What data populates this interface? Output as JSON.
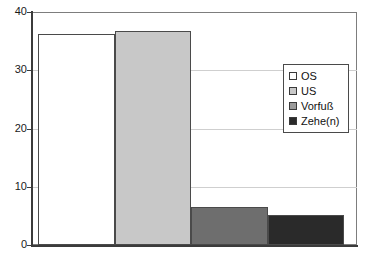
{
  "chart_data": {
    "type": "bar",
    "title": "",
    "subtitle": "",
    "xlabel": "",
    "ylabel": "",
    "ylim": [
      0,
      40
    ],
    "yticks": [
      0,
      10,
      20,
      30,
      40
    ],
    "ytick_labels": [
      "0",
      "10",
      "20",
      "30",
      "40"
    ],
    "grid": true,
    "gridlines_at": [
      10,
      20,
      30
    ],
    "legend_position": "top-right",
    "categories": [
      "OS",
      "US",
      "Vorfuß",
      "Zehe(n)"
    ],
    "values": [
      36.2,
      36.7,
      6.5,
      5.2
    ],
    "series": [
      {
        "name": "Anteil",
        "values": [
          36.2,
          36.7,
          6.5,
          5.2
        ]
      }
    ],
    "colors": [
      "#ffffff",
      "#c8c8c8",
      "#6e6e6e",
      "#2a2a2a"
    ],
    "bar_edge_color": "#4a4a4a",
    "legend": [
      {
        "label": "OS",
        "color": "#ffffff"
      },
      {
        "label": "US",
        "color": "#c8c8c8"
      },
      {
        "label": "Vorfuß",
        "color": "#9a9a9a"
      },
      {
        "label": "Zehe(n)",
        "color": "#2a2a2a"
      }
    ],
    "axis_color": "#3b3b3b",
    "grid_color": "#cfcfcf",
    "background": "#ffffff"
  }
}
